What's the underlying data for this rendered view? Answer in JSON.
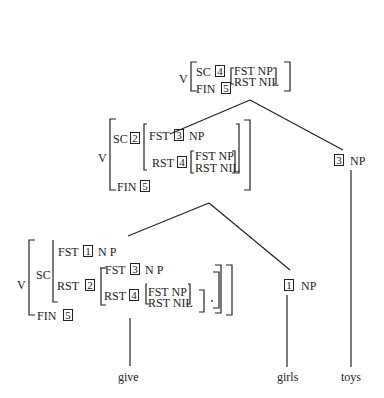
{
  "top": {
    "cat": "V",
    "sc_label": "SC",
    "sc_tag": "4",
    "fst": "FST NP",
    "rst": "RST NIL",
    "fin_label": "FIN",
    "fin_tag": "5"
  },
  "mid": {
    "cat": "V",
    "sc_label": "SC",
    "sc_tag": "2",
    "fst_label": "FST",
    "fst_tag": "3",
    "fst_val": "NP",
    "rst_label": "RST",
    "rst_tag": "4",
    "inner_fst": "FST NP",
    "inner_rst": "RST NIL",
    "fin_label": "FIN",
    "fin_tag": "5"
  },
  "low": {
    "cat": "V",
    "sc_label": "SC",
    "fst_label": "FST",
    "fst_tag": "1",
    "fst_val": "N P",
    "rst_label": "RST",
    "rst_tag": "2",
    "rfst_label": "FST",
    "rfst_tag": "3",
    "rfst_val": "N P",
    "rrst_label": "RST",
    "rrst_tag": "4",
    "inner_fst": "FST NP",
    "inner_rst": "RST NIL",
    "fin_label": "FIN",
    "fin_tag": "5"
  },
  "np_toys": {
    "tag": "3",
    "cat": "NP",
    "word": "toys"
  },
  "np_girls": {
    "tag": "1",
    "cat": "NP",
    "word": "girls"
  },
  "verb": {
    "word": "give"
  }
}
